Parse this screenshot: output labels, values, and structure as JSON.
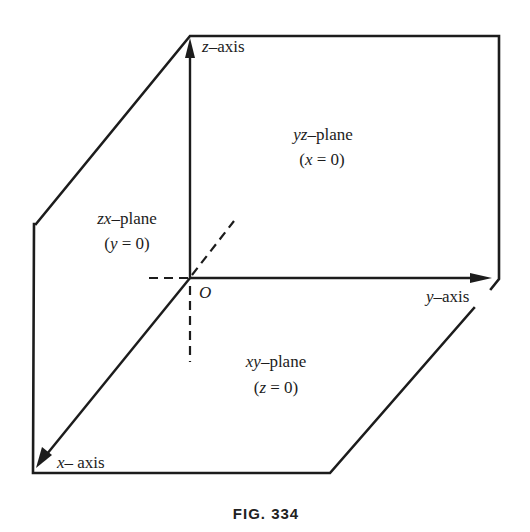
{
  "figure": {
    "caption": "FIG. 334",
    "origin_label": "O",
    "axes": {
      "z": {
        "var": "z",
        "suffix": "–axis"
      },
      "y": {
        "var": "y",
        "suffix": "–axis"
      },
      "x": {
        "var": "x",
        "suffix": "– axis"
      }
    },
    "planes": {
      "yz": {
        "name_var": "yz",
        "name_suffix": "–plane",
        "eq_open": "(",
        "eq_var": "x",
        "eq_rest": " = 0)"
      },
      "zx": {
        "name_var": "zx",
        "name_suffix": "–plane",
        "eq_open": "(",
        "eq_var": "y",
        "eq_rest": " = 0)"
      },
      "xy": {
        "name_var": "xy",
        "name_suffix": "–plane",
        "eq_open": "(",
        "eq_var": "z",
        "eq_rest": " = 0)"
      }
    },
    "colors": {
      "ink": "#1c1c1c",
      "background": "#ffffff"
    }
  }
}
